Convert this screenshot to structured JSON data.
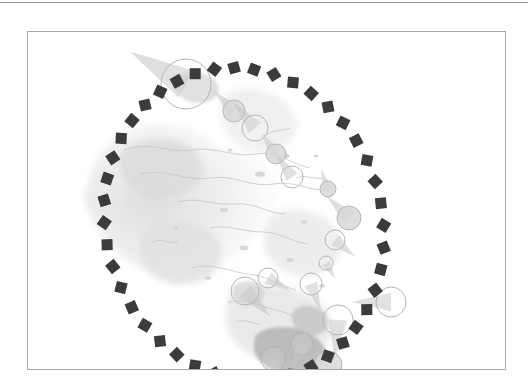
{
  "page": {
    "background_color": "#ffffff",
    "top_rule_color": "#9a9a9a",
    "frame_color": "#a8a8a8"
  },
  "figure": {
    "name": "map-figure",
    "type": "map",
    "frame": {
      "x": 27,
      "y": 28,
      "width": 479,
      "height": 339
    }
  },
  "map_layers": {
    "terrain_color_light": "#efefef",
    "terrain_color_mid": "#e2e2e2",
    "terrain_color_dark": "#cfcfcf",
    "coastline_color": "#c8c8c8",
    "landmass_highlight": "#b9b9b9"
  },
  "ellipse": {
    "name": "dashed-ellipse-overlay",
    "center_x": 216,
    "center_y": 192,
    "radius_x": 138,
    "radius_y": 158,
    "rotation_deg": -18,
    "marker_shape": "square",
    "marker_color": "#3b3b3b",
    "marker_size": 11,
    "marker_count": 44
  },
  "markers": {
    "circle_stroke_color": "#b5b5b5",
    "circle_fill_color": "#d8d8d8",
    "tail_color": "#c4c4c4",
    "items": [
      {
        "name": "marker-large-top",
        "cx": 158,
        "cy": 52,
        "r": 25,
        "filled": false,
        "tail_deg": 210
      },
      {
        "name": "marker-2",
        "cx": 206,
        "cy": 79,
        "r": 11,
        "filled": true,
        "tail_deg": 225
      },
      {
        "name": "marker-3",
        "cx": 227,
        "cy": 96,
        "r": 13,
        "filled": false,
        "tail_deg": 230
      },
      {
        "name": "marker-4",
        "cx": 248,
        "cy": 122,
        "r": 10,
        "filled": true,
        "tail_deg": 235
      },
      {
        "name": "marker-5",
        "cx": 264,
        "cy": 145,
        "r": 11,
        "filled": false,
        "tail_deg": 235
      },
      {
        "name": "marker-6",
        "cx": 300,
        "cy": 157,
        "r": 8,
        "filled": true,
        "tail_deg": 250
      },
      {
        "name": "marker-7",
        "cx": 321,
        "cy": 186,
        "r": 12,
        "filled": true,
        "tail_deg": 225
      },
      {
        "name": "marker-8",
        "cx": 307,
        "cy": 208,
        "r": 10,
        "filled": false,
        "tail_deg": 40
      },
      {
        "name": "marker-9",
        "cx": 298,
        "cy": 231,
        "r": 7,
        "filled": false,
        "tail_deg": 60
      },
      {
        "name": "marker-10",
        "cx": 283,
        "cy": 252,
        "r": 11,
        "filled": false,
        "tail_deg": 70
      },
      {
        "name": "marker-11",
        "cx": 217,
        "cy": 259,
        "r": 14,
        "filled": false,
        "tail_deg": 45
      },
      {
        "name": "marker-12",
        "cx": 240,
        "cy": 246,
        "r": 10,
        "filled": false,
        "tail_deg": 30
      },
      {
        "name": "marker-13",
        "cx": 310,
        "cy": 288,
        "r": 15,
        "filled": false,
        "tail_deg": 95
      },
      {
        "name": "marker-14",
        "cx": 274,
        "cy": 312,
        "r": 11,
        "filled": false,
        "tail_deg": 110
      },
      {
        "name": "marker-15",
        "cx": 300,
        "cy": 333,
        "r": 14,
        "filled": true,
        "tail_deg": 120
      },
      {
        "name": "marker-16",
        "cx": 363,
        "cy": 270,
        "r": 15,
        "filled": false,
        "tail_deg": 180
      },
      {
        "name": "marker-17",
        "cx": 245,
        "cy": 327,
        "r": 12,
        "filled": false,
        "tail_deg": 100
      }
    ]
  }
}
